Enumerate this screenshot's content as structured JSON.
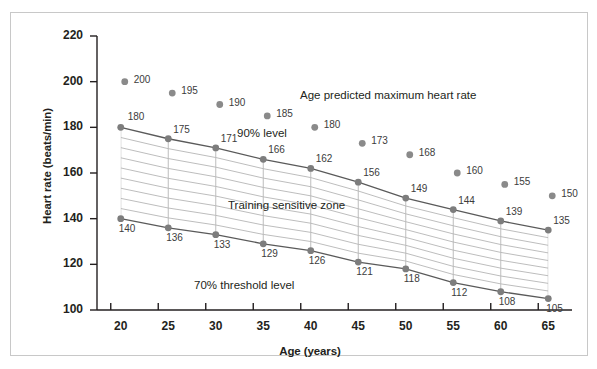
{
  "chart_data": {
    "type": "scatter",
    "title": "",
    "xlabel": "Age (years)",
    "ylabel": "Heart rate (beats/min)",
    "x": [
      20,
      25,
      30,
      35,
      40,
      45,
      50,
      55,
      60,
      65
    ],
    "xtick_labels": [
      "20",
      "25",
      "30",
      "35",
      "40",
      "45",
      "50",
      "55",
      "60",
      "65"
    ],
    "ytick_labels": [
      "100",
      "120",
      "140",
      "160",
      "180",
      "200",
      "220"
    ],
    "yticks": [
      100,
      120,
      140,
      160,
      180,
      200,
      220
    ],
    "xlim": [
      17.5,
      67.5
    ],
    "ylim": [
      100,
      220
    ],
    "grid": false,
    "legend": "none",
    "series": [
      {
        "name": "Age predicted maximum heart rate",
        "values": [
          200,
          195,
          190,
          185,
          180,
          173,
          168,
          160,
          155,
          150
        ],
        "line": false,
        "marker_color": "#8a8a8a"
      },
      {
        "name": "90% level",
        "values": [
          180,
          175,
          171,
          166,
          162,
          156,
          149,
          144,
          139,
          135
        ],
        "line": true,
        "marker_color": "#7d7d7d"
      },
      {
        "name": "70% threshold level",
        "values": [
          140,
          136,
          133,
          129,
          126,
          121,
          118,
          112,
          108,
          105
        ],
        "line": true,
        "marker_color": "#7d7d7d"
      }
    ],
    "annotations": [
      {
        "text": "Age predicted maximum heart rate",
        "x": 300,
        "y": 89
      },
      {
        "text": "90% level",
        "x": 237,
        "y": 127
      },
      {
        "text": "Training sensitive zone",
        "x": 228,
        "y": 199
      },
      {
        "text": "70% threshold level",
        "x": 194,
        "y": 279
      }
    ],
    "shaded_region": {
      "name": "Training sensitive zone",
      "upper_series": "90% level",
      "lower_series": "70% threshold level",
      "hatch": "horizontal-and-vertical lines",
      "hatch_color": "#b5b5b5"
    },
    "colors": {
      "marker": "#8a8a8a",
      "line": "#5a5a5a",
      "hatch": "#b5b5b5",
      "axis": "#231f20",
      "frame": "#c8c8c8",
      "background": "#ffffff",
      "text": "#231f20"
    }
  }
}
